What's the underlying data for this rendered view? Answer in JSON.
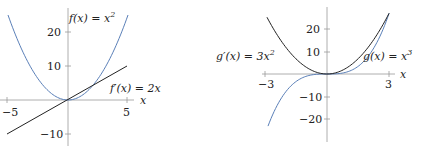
{
  "chart_data": [
    {
      "type": "line",
      "title": "",
      "xlabel": "x",
      "ylabel": "",
      "xlim": [
        -5.5,
        5.5
      ],
      "ylim": [
        -11,
        26
      ],
      "x_ticks": [
        -5,
        5
      ],
      "y_ticks": [
        20,
        10,
        -10
      ],
      "x_tick_labels": [
        "−5",
        "5"
      ],
      "y_tick_labels": [
        "20",
        "10",
        "−10"
      ],
      "grid": false,
      "series": [
        {
          "name": "f(x) = x²",
          "color": "#5a7fb8",
          "domain": [
            -5,
            5
          ],
          "x": [
            -5,
            -4,
            -3,
            -2,
            -1,
            0,
            1,
            2,
            3,
            4,
            5
          ],
          "values": [
            25,
            16,
            9,
            4,
            1,
            0,
            1,
            4,
            9,
            16,
            25
          ]
        },
        {
          "name": "f′(x) = 2x",
          "color": "#222222",
          "domain": [
            -5,
            5
          ],
          "x": [
            -5,
            0,
            5
          ],
          "values": [
            -10,
            0,
            10
          ]
        }
      ],
      "annotations": [
        {
          "text": "f(x) = x²",
          "near": "top of y-axis"
        },
        {
          "text": "f′(x) = 2x",
          "near": "right end of line"
        }
      ]
    },
    {
      "type": "line",
      "title": "",
      "xlabel": "x",
      "ylabel": "",
      "xlim": [
        -3.3,
        3.4
      ],
      "ylim": [
        -28,
        30
      ],
      "x_ticks": [
        -3,
        3
      ],
      "y_ticks": [
        20,
        10,
        -10,
        -20
      ],
      "x_tick_labels": [
        "−3",
        "3"
      ],
      "y_tick_labels": [
        "20",
        "10",
        "−10",
        "−20"
      ],
      "grid": false,
      "series": [
        {
          "name": "g(x) = x³",
          "color": "#5a7fb8",
          "domain": [
            -3,
            3
          ],
          "x": [
            -3,
            -2,
            -1,
            0,
            1,
            2,
            3
          ],
          "values": [
            -27,
            -8,
            -1,
            0,
            1,
            8,
            27
          ]
        },
        {
          "name": "g′(x) = 3x²",
          "color": "#222222",
          "domain": [
            -3,
            3
          ],
          "x": [
            -3,
            -2,
            -1,
            0,
            1,
            2,
            3
          ],
          "values": [
            27,
            12,
            3,
            0,
            3,
            12,
            27
          ]
        }
      ],
      "annotations": [
        {
          "text": "g′(x) = 3x²",
          "near": "left of plot"
        },
        {
          "text": "g(x) = x³",
          "near": "right of plot"
        }
      ]
    }
  ],
  "left": {
    "xlabel": "x",
    "ticks": {
      "xm5": "−5",
      "x5": "5",
      "y20": "20",
      "y10": "10",
      "ym10": "−10"
    },
    "label_f": "f(x) = x",
    "label_f_exp": "2",
    "label_fp": "f′(x) = 2x"
  },
  "right": {
    "xlabel": "x",
    "ticks": {
      "xm3": "−3",
      "x3": "3",
      "y20": "20",
      "y10": "10",
      "ym10": "−10",
      "ym20": "−20"
    },
    "label_gp": "g′(x) = 3x",
    "label_gp_exp": "2",
    "label_g": "g(x) = x",
    "label_g_exp": "3"
  },
  "colors": {
    "blue": "#5a7fb8",
    "black": "#222222",
    "axis": "#9a9a9a"
  }
}
